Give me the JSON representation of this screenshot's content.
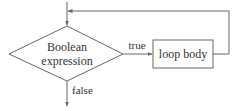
{
  "diagram": {
    "type": "flowchart",
    "decision": {
      "line1": "Boolean",
      "line2": "expression"
    },
    "process": {
      "label": "loop body"
    },
    "edges": {
      "true_label": "true",
      "false_label": "false"
    },
    "colors": {
      "stroke": "#666666",
      "text": "#333333",
      "background": "#ffffff"
    }
  }
}
